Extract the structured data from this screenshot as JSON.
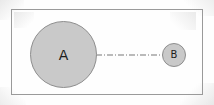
{
  "diagram": {
    "background_color": "#fefefe",
    "frame": {
      "name": "bounding-box",
      "stroke_color": "#9a9a9a",
      "stroke_width": 1
    },
    "nodes": [
      {
        "id": "A",
        "label": "A",
        "shape": "circle",
        "fill_color": "#c9c9c9",
        "stroke_color": "#8e8e8e",
        "center_x": 63,
        "center_y": 55,
        "diameter": 67
      },
      {
        "id": "B",
        "label": "B",
        "shape": "circle",
        "fill_color": "#c9c9c9",
        "stroke_color": "#8e8e8e",
        "center_x": 174,
        "center_y": 55,
        "diameter": 24
      }
    ],
    "connector": {
      "name": "dash-dot-connector",
      "from": "A",
      "to": "B",
      "style": "dash-dot",
      "stroke_color": "#777777",
      "stroke_width": 1,
      "x_start": 96,
      "x_end": 163,
      "y": 55
    }
  }
}
